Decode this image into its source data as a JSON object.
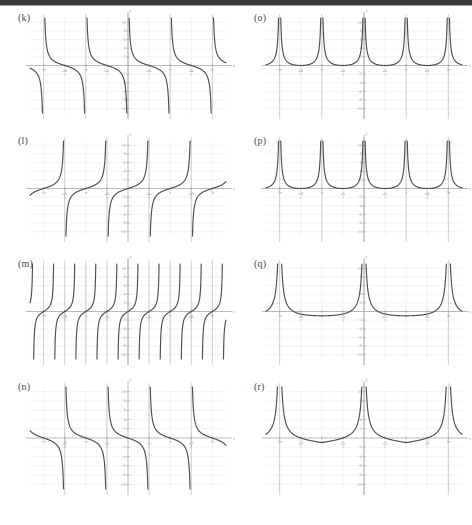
{
  "figure": {
    "panel_count": 8,
    "columns": 2,
    "rows": 4,
    "background_color": "#ffffff",
    "curve_color": "#4d4d4d",
    "axis_color": "#9b9b9b",
    "asymptote_color": "#bdbdbd",
    "grid_color": "#e2e2e2",
    "header_bar_color": "#3a3a3a"
  },
  "axis_ticks": {
    "x_labels": [
      "-2π",
      "-3π/2",
      "-π",
      "-π/2",
      "π/2",
      "π",
      "3π/2",
      "2π"
    ],
    "x_values": [
      -6.2832,
      -4.7124,
      -3.1416,
      -1.5708,
      1.5708,
      3.1416,
      4.7124,
      6.2832
    ],
    "x_axis_end_label": "x",
    "y_axis_label": "y",
    "y_labels_positive": [
      "2",
      "4",
      "6",
      "8",
      "10"
    ],
    "y_labels_negative": [
      "-2",
      "-4",
      "-6",
      "-8",
      "-10"
    ]
  },
  "panels": [
    {
      "id": "k",
      "label": "(k)",
      "position": "row1-col1",
      "chart_data": {
        "type": "line",
        "function": "tangent-family",
        "description": "Decreasing branches between vertical asymptotes; cotangent-like shape with period pi",
        "period": 3.1416,
        "asymptotes": [
          -6.2832,
          -3.1416,
          0.0,
          3.1416,
          6.2832
        ],
        "branch_direction": "decreasing",
        "xlim": [
          -7.3,
          7.3
        ],
        "ylim": [
          -11,
          11
        ],
        "xlabel": "x",
        "ylabel": "y",
        "grid": true
      }
    },
    {
      "id": "l",
      "label": "(l)",
      "position": "row2-col1",
      "chart_data": {
        "type": "line",
        "function": "tangent-family",
        "description": "Increasing branches between vertical asymptotes at odd multiples of pi/2, tangent-like",
        "period": 3.1416,
        "asymptotes": [
          -4.7124,
          -1.5708,
          1.5708,
          4.7124
        ],
        "branch_direction": "increasing",
        "xlim": [
          -7.3,
          7.3
        ],
        "ylim": [
          -11,
          11
        ],
        "xlabel": "x",
        "ylabel": "y",
        "grid": true
      }
    },
    {
      "id": "m",
      "label": "(m)",
      "position": "row3-col1",
      "chart_data": {
        "type": "line",
        "function": "tangent-family-high-frequency",
        "description": "Increasing branches with asymptotes every pi/2; doubled frequency tangent",
        "period": 1.5708,
        "asymptotes": [
          -6.2832,
          -4.7124,
          -3.1416,
          -1.5708,
          0.0,
          1.5708,
          3.1416,
          4.7124,
          6.2832
        ],
        "branch_direction": "increasing",
        "xlim": [
          -7.3,
          7.3
        ],
        "ylim": [
          -11,
          11
        ],
        "xlabel": "x",
        "ylabel": "y",
        "grid": true
      }
    },
    {
      "id": "n",
      "label": "(n)",
      "position": "row4-col1",
      "chart_data": {
        "type": "line",
        "function": "cotangent-family",
        "description": "Decreasing branches with asymptotes at odd multiples of pi/2",
        "period": 3.1416,
        "asymptotes": [
          -4.7124,
          -1.5708,
          1.5708,
          4.7124
        ],
        "branch_direction": "decreasing",
        "xlim": [
          -7.3,
          7.3
        ],
        "ylim": [
          -11,
          11
        ],
        "xlabel": "x",
        "ylabel": "y",
        "grid": true
      }
    },
    {
      "id": "o",
      "label": "(o)",
      "position": "row1-col2",
      "chart_data": {
        "type": "line",
        "function": "secant-family-absolute",
        "description": "U-shaped branches all above the x-axis with minima touching y=0 at odd multiples of pi/2",
        "period": 3.1416,
        "asymptotes": [
          -6.2832,
          -3.1416,
          0.0,
          3.1416,
          6.2832
        ],
        "minima_x": [
          -4.7124,
          -1.5708,
          1.5708,
          4.7124
        ],
        "minima_y": 0,
        "xlim": [
          -7.3,
          7.3
        ],
        "ylim": [
          -11,
          11
        ],
        "xlabel": "x",
        "ylabel": "y",
        "grid": true
      }
    },
    {
      "id": "p",
      "label": "(p)",
      "position": "row2-col2",
      "chart_data": {
        "type": "line",
        "function": "secant-family-absolute",
        "description": "U-shaped branches above the axis touching y=0, same family as panel (o)",
        "period": 3.1416,
        "asymptotes": [
          -6.2832,
          -3.1416,
          0.0,
          3.1416,
          6.2832
        ],
        "minima_x": [
          -4.7124,
          -1.5708,
          1.5708,
          4.7124
        ],
        "minima_y": 0,
        "xlim": [
          -7.3,
          7.3
        ],
        "ylim": [
          -11,
          11
        ],
        "xlabel": "x",
        "ylabel": "y",
        "grid": true
      }
    },
    {
      "id": "q",
      "label": "(q)",
      "position": "row3-col2",
      "chart_data": {
        "type": "line",
        "function": "secant-family-shifted",
        "description": "Wide U-shaped branches with minima dipping to about y=-1 between asymptotes at odd multiples of pi/2",
        "period": 6.2832,
        "asymptotes": [
          -6.2832,
          0.0,
          6.2832
        ],
        "minima_x": [
          -3.1416,
          3.1416
        ],
        "minima_y": -1,
        "xlim": [
          -7.3,
          7.3
        ],
        "ylim": [
          -11,
          11
        ],
        "xlabel": "x",
        "ylabel": "y",
        "grid": true
      }
    },
    {
      "id": "r",
      "label": "(r)",
      "position": "row4-col2",
      "chart_data": {
        "type": "line",
        "function": "secant-family-absolute-wide",
        "description": "W-shaped pattern: branches touch y=0 at odd multiples of pi/2 with a local hump between them",
        "period": 6.2832,
        "asymptotes": [
          -6.2832,
          0.0,
          6.2832
        ],
        "zeros_x": [
          -4.7124,
          -1.5708,
          1.5708,
          4.7124
        ],
        "hump_x": [
          -3.1416,
          3.1416
        ],
        "hump_y": 1,
        "xlim": [
          -7.3,
          7.3
        ],
        "ylim": [
          -11,
          11
        ],
        "xlabel": "x",
        "ylabel": "y",
        "grid": true
      }
    }
  ]
}
